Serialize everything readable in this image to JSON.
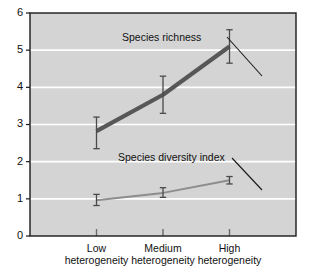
{
  "chart_data": {
    "type": "line",
    "title": "",
    "xlabel": "",
    "ylabel": "",
    "categories": [
      "Low\nheterogeneity",
      "Medium\nheterogeneity",
      "High\nheterogeneity"
    ],
    "category_lines": [
      [
        "Low",
        "heterogeneity"
      ],
      [
        "Medium",
        "heterogeneity"
      ],
      [
        "High",
        "heterogeneity"
      ]
    ],
    "x": [
      1,
      2,
      3
    ],
    "ylim": [
      0,
      6
    ],
    "yticks": [
      0,
      1,
      2,
      3,
      4,
      5,
      6
    ],
    "ytick_labels": [
      "0",
      "1",
      "2",
      "3",
      "4",
      "5",
      "6"
    ],
    "grid": true,
    "grid_axis": "y",
    "grid_color": "#ffffff",
    "plot_background": "#d4d4d4",
    "frame_color": "#1a1a1a",
    "legend": "annotations",
    "series": [
      {
        "name": "Species richness",
        "values": [
          2.82,
          3.8,
          5.1
        ],
        "err_low": [
          2.35,
          3.3,
          4.65
        ],
        "err_high": [
          3.2,
          4.3,
          5.55
        ],
        "color": "#575757",
        "line_width": 4.2
      },
      {
        "name": "Species diversity index",
        "values": [
          0.96,
          1.16,
          1.5
        ],
        "err_low": [
          0.82,
          1.04,
          1.4
        ],
        "err_high": [
          1.12,
          1.3,
          1.6
        ],
        "color": "#8d8d8d",
        "line_width": 2.0
      }
    ],
    "annotations": [
      {
        "text": "Species richness",
        "text_x": 122,
        "text_y": 41,
        "leader": [
          [
            227,
            37
          ],
          [
            262,
            76
          ]
        ]
      },
      {
        "text": "Species diversity index",
        "text_x": 118,
        "text_y": 161,
        "leader": [
          [
            232,
            158
          ],
          [
            262,
            190
          ]
        ]
      }
    ]
  }
}
